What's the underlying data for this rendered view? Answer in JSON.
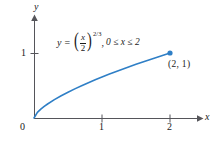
{
  "figure": {
    "background_color": "#ffffff",
    "curve_color": "#2f7fc6",
    "axis_color": "#55555a",
    "text_color": "#1a1a1a"
  },
  "axes": {
    "x_label": "x",
    "y_label": "y",
    "x_ticks": [
      "1",
      "2"
    ],
    "y_ticks": [
      "1"
    ],
    "origin_label": "0"
  },
  "annotations": {
    "equation": {
      "lhs": "y",
      "equals": "=",
      "left_paren": "(",
      "numerator": "x",
      "denominator": "2",
      "right_paren": ")",
      "exponent": "2/3",
      "comma": ",",
      "domain": "0 ≤ x ≤ 2",
      "full_text": "y = (x/2)^(2/3), 0 ≤ x ≤ 2"
    },
    "endpoint_label": "(2, 1)"
  },
  "chart_data": {
    "type": "line",
    "title": "",
    "xlabel": "x",
    "ylabel": "y",
    "equation": "y = (x/2)^(2/3)",
    "domain_text": "0 ≤ x ≤ 2",
    "xlim": [
      0,
      2.45
    ],
    "ylim": [
      0,
      1.45
    ],
    "xticks": [
      1,
      2
    ],
    "yticks": [
      1
    ],
    "xtick_labels": [
      "1",
      "2"
    ],
    "ytick_labels": [
      "1"
    ],
    "grid": false,
    "legend": false,
    "series": [
      {
        "name": "y = (x/2)^(2/3)",
        "color": "#2f7fc6",
        "x": [
          0,
          0.05,
          0.1,
          0.15,
          0.2,
          0.3,
          0.4,
          0.5,
          0.6,
          0.7,
          0.8,
          0.9,
          1.0,
          1.1,
          1.2,
          1.3,
          1.4,
          1.5,
          1.6,
          1.7,
          1.8,
          1.9,
          2.0
        ],
        "y": [
          0,
          0.0855,
          0.1357,
          0.1779,
          0.2154,
          0.2823,
          0.342,
          0.3969,
          0.4481,
          0.4966,
          0.5429,
          0.5872,
          0.63,
          0.6714,
          0.7114,
          0.7504,
          0.7884,
          0.8255,
          0.8618,
          0.8972,
          0.932,
          0.9663,
          1.0
        ]
      }
    ],
    "markers": [
      {
        "label": "(2, 1)",
        "x": 2,
        "y": 1,
        "color": "#2f7fc6",
        "style": "filled-circle"
      }
    ]
  }
}
